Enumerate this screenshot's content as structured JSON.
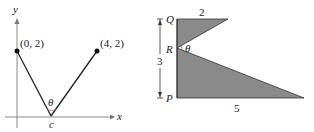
{
  "figure_left": {
    "x_axis_label": "x",
    "y_axis_label": "y",
    "point_a_label": "(0, 2)",
    "point_b_label": "(4, 2)",
    "vertex_label": "c",
    "angle_label": "θ"
  },
  "figure_right": {
    "vertex_q": "Q",
    "vertex_r": "R",
    "vertex_p": "P",
    "top_length": "2",
    "height_length": "3",
    "base_length": "5",
    "angle_label": "θ",
    "fill_color": "#8a8a8a"
  }
}
